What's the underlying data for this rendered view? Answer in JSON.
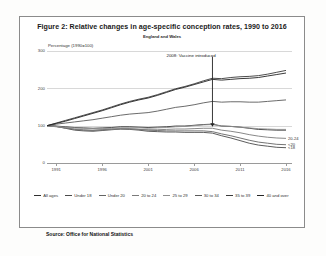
{
  "figure": {
    "title": "Figure 2: Relative changes in age-specific conception rates, 1990 to 2016",
    "subtitle": "England and Wales",
    "source": "Source: Office for National Statistics"
  },
  "chart_data": {
    "type": "line",
    "title": "Figure 2: Relative changes in age-specific conception rates, 1990 to 2016",
    "subtitle": "England and Wales",
    "xlabel": "",
    "ylabel": "Percentage (1990=100)",
    "ylim": [
      0,
      300
    ],
    "yticks": [
      0,
      100,
      200,
      300
    ],
    "xlim": [
      1990,
      2016
    ],
    "xticks": [
      1991,
      1996,
      2001,
      2006,
      2011,
      2016
    ],
    "grid": true,
    "legend_position": "bottom",
    "x": [
      1990,
      1991,
      1992,
      1993,
      1994,
      1995,
      1996,
      1997,
      1998,
      1999,
      2000,
      2001,
      2002,
      2003,
      2004,
      2005,
      2006,
      2007,
      2008,
      2009,
      2010,
      2011,
      2012,
      2013,
      2014,
      2015,
      2016
    ],
    "series": [
      {
        "name": "All ages",
        "color": "#2f2f2f",
        "values": [
          100,
          99,
          97,
          95,
          94,
          93,
          94,
          95,
          97,
          97,
          96,
          95,
          96,
          97,
          99,
          99,
          101,
          103,
          104,
          99,
          98,
          96,
          93,
          90,
          89,
          88,
          88
        ]
      },
      {
        "name": "Under 18",
        "color": "#4a4a4a",
        "values": [
          100,
          98,
          93,
          88,
          86,
          85,
          87,
          89,
          91,
          90,
          88,
          85,
          84,
          83,
          83,
          82,
          82,
          82,
          80,
          73,
          67,
          60,
          53,
          48,
          45,
          42,
          41
        ]
      },
      {
        "name": "Under 20",
        "color": "#646464",
        "values": [
          100,
          98,
          94,
          90,
          88,
          87,
          89,
          91,
          92,
          92,
          90,
          88,
          87,
          86,
          86,
          86,
          86,
          86,
          84,
          78,
          73,
          67,
          61,
          56,
          53,
          50,
          49
        ]
      },
      {
        "name": "20 to 24",
        "color": "#7a7a7a",
        "values": [
          100,
          97,
          94,
          91,
          89,
          88,
          89,
          90,
          91,
          91,
          90,
          89,
          89,
          90,
          91,
          91,
          92,
          93,
          93,
          88,
          85,
          81,
          76,
          72,
          69,
          67,
          66
        ]
      },
      {
        "name": "25 to 29",
        "color": "#8f8f8f",
        "values": [
          100,
          98,
          96,
          94,
          93,
          92,
          92,
          93,
          94,
          94,
          94,
          93,
          94,
          95,
          97,
          98,
          100,
          102,
          103,
          99,
          98,
          96,
          94,
          92,
          91,
          90,
          90
        ]
      },
      {
        "name": "30 to 34",
        "color": "#5a5a5a",
        "values": [
          100,
          104,
          107,
          110,
          113,
          116,
          120,
          124,
          128,
          131,
          133,
          135,
          139,
          144,
          149,
          152,
          156,
          161,
          165,
          163,
          164,
          164,
          163,
          163,
          165,
          167,
          169
        ]
      },
      {
        "name": "35 to 39",
        "color": "#3a3a3a",
        "values": [
          100,
          107,
          114,
          121,
          128,
          135,
          142,
          150,
          158,
          165,
          171,
          176,
          183,
          191,
          199,
          205,
          212,
          220,
          227,
          226,
          229,
          231,
          232,
          234,
          238,
          243,
          248
        ]
      },
      {
        "name": "40 and over",
        "color": "#252525",
        "values": [
          100,
          106,
          112,
          119,
          126,
          133,
          140,
          148,
          156,
          163,
          169,
          174,
          181,
          189,
          197,
          203,
          210,
          217,
          224,
          222,
          224,
          226,
          227,
          229,
          233,
          237,
          241
        ]
      }
    ],
    "annotations": [
      {
        "text": "2008: Vaccine introduced",
        "x": 2008,
        "y": 100
      }
    ],
    "edge_labels": [
      {
        "text": "20-24"
      },
      {
        "text": "<20"
      },
      {
        "text": "<18"
      }
    ]
  }
}
